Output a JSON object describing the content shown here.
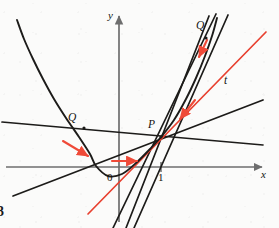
{
  "figure": {
    "figure_label": "3",
    "caption_visible": false
  },
  "axes": {
    "x_label": "x",
    "y_label": "y",
    "origin_label": "0",
    "tick_labels": [
      "1"
    ],
    "x_axis_y_px": 167,
    "y_axis_x_px": 119,
    "unit_px": 42,
    "axis_color": "#6e6e6e"
  },
  "points": [
    {
      "name": "P",
      "label": "P",
      "x_px": 161,
      "y_px": 137,
      "label_x_px": 148,
      "label_y_px": 121
    },
    {
      "name": "Q-left",
      "label": "Q",
      "x_px": 84,
      "y_px": 128,
      "label_x_px": 69,
      "label_y_px": 114
    },
    {
      "name": "Q-right",
      "label": "Q",
      "x_px": 206,
      "y_px": 38,
      "label_x_px": 197,
      "label_y_px": 22
    }
  ],
  "tangent": {
    "label": "t",
    "label_x_px": 224,
    "label_y_px": 76,
    "color": "#e8402f"
  },
  "colors": {
    "curve": "#1c1b19",
    "secant": "#1c1b19",
    "tangent": "#e8402f",
    "arrow": "#ef4a38",
    "axis": "#6e6e6e",
    "background": "#fbfbfa"
  },
  "chart_data": {
    "type": "line",
    "title": "",
    "xlabel": "x",
    "ylabel": "y",
    "grid": false,
    "legend": null,
    "annotations": [
      "P",
      "Q",
      "Q",
      "t",
      "0",
      "1",
      "3"
    ],
    "curve": {
      "name": "y = f(x)",
      "kind": "parabola",
      "vertex_px": [
        96,
        166
      ],
      "points_px": [
        [
          17,
          20
        ],
        [
          24,
          39
        ],
        [
          33,
          59
        ],
        [
          43,
          79
        ],
        [
          54,
          99
        ],
        [
          66,
          118
        ],
        [
          79,
          137
        ],
        [
          90,
          154
        ],
        [
          96,
          166
        ],
        [
          108,
          176
        ],
        [
          122,
          174
        ],
        [
          136,
          163
        ],
        [
          150,
          149
        ],
        [
          161,
          137
        ],
        [
          174,
          120
        ],
        [
          186,
          99
        ],
        [
          196,
          78
        ],
        [
          205,
          56
        ],
        [
          212,
          36
        ],
        [
          217,
          18
        ]
      ]
    },
    "secant_lines": [
      {
        "name": "secant-1-shallow-left",
        "from_px": [
          2,
          122
        ],
        "to_px": [
          263,
          145
        ],
        "style": "solid",
        "color": "#1c1b19"
      },
      {
        "name": "secant-2-rising-left",
        "from_px": [
          13,
          196
        ],
        "to_px": [
          263,
          100
        ],
        "style": "solid",
        "color": "#1c1b19"
      },
      {
        "name": "secant-3-steep",
        "from_px": [
          113,
          228
        ],
        "to_px": [
          216,
          14
        ],
        "style": "solid",
        "color": "#1c1b19"
      },
      {
        "name": "secant-4-steeper",
        "from_px": [
          134,
          228
        ],
        "to_px": [
          228,
          15
        ],
        "style": "solid",
        "color": "#1c1b19"
      },
      {
        "name": "secant-5-through-Q-right",
        "from_px": [
          126,
          228
        ],
        "to_px": [
          209,
          16
        ],
        "style": "solid",
        "color": "#1c1b19"
      }
    ],
    "tangent_lines": [
      {
        "name": "tangent-t",
        "from_px": [
          88,
          214
        ],
        "to_px": [
          266,
          32
        ],
        "color": "#e8402f"
      }
    ],
    "arrows": [
      {
        "name": "arrow-left-on-curve",
        "from_px": [
          63,
          141
        ],
        "to_px": [
          88,
          156
        ],
        "color": "#ef4a38"
      },
      {
        "name": "arrow-left-on-axis",
        "from_px": [
          112,
          161
        ],
        "to_px": [
          137,
          161
        ],
        "color": "#ef4a38"
      },
      {
        "name": "arrow-right-upper",
        "from_px": [
          207,
          40
        ],
        "to_px": [
          199,
          57
        ],
        "color": "#ef4a38"
      },
      {
        "name": "arrow-right-lower",
        "from_px": [
          195,
          100
        ],
        "to_px": [
          180,
          119
        ],
        "color": "#ef4a38"
      }
    ]
  }
}
